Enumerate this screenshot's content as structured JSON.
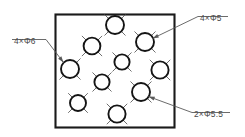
{
  "drawing": {
    "title": "Hole pattern detail",
    "canvas": {
      "width": 245,
      "height": 137,
      "background": "#ffffff"
    },
    "line_color": "#141414",
    "leader_color": "#5a5a5a",
    "centerline_color": "#555555",
    "plate": {
      "name": "plate-outline",
      "x": 55.5,
      "y": 14.5,
      "width": 119,
      "height": 113
    },
    "holes": [
      {
        "id": "hole-1",
        "cx": 115,
        "cy": 25,
        "r": 9.0,
        "callout": "4×Φ5"
      },
      {
        "id": "hole-2",
        "cx": 92,
        "cy": 46,
        "r": 8.4,
        "callout": "4×Φ6"
      },
      {
        "id": "hole-3",
        "cx": 145,
        "cy": 42,
        "r": 9.0,
        "callout": "4×Φ5"
      },
      {
        "id": "hole-4",
        "cx": 70,
        "cy": 69,
        "r": 9.0,
        "callout": "4×Φ6"
      },
      {
        "id": "hole-5",
        "cx": 122,
        "cy": 62,
        "r": 7.6,
        "callout": "4×Φ6"
      },
      {
        "id": "hole-6",
        "cx": 160,
        "cy": 70,
        "r": 8.6,
        "callout": "4×Φ5"
      },
      {
        "id": "hole-7",
        "cx": 102,
        "cy": 82,
        "r": 7.6,
        "callout": "4×Φ6"
      },
      {
        "id": "hole-8",
        "cx": 141,
        "cy": 92,
        "r": 9.0,
        "callout": "2×Φ5.5"
      },
      {
        "id": "hole-9",
        "cx": 78,
        "cy": 103,
        "r": 8.0,
        "callout": "4×Φ6"
      },
      {
        "id": "hole-10",
        "cx": 117,
        "cy": 114,
        "r": 8.6,
        "callout": "2×Φ5.5"
      }
    ],
    "callouts": [
      {
        "id": "callout-4x-d6",
        "label": "4×Φ6",
        "text_x": 14,
        "text_y": 37,
        "shelf": {
          "x1": 12,
          "y1": 39.5,
          "x2": 46,
          "y2": 39.5
        },
        "leader": {
          "x1": 46,
          "y1": 39.5,
          "x2": 63.5,
          "y2": 62.5
        },
        "arrow_angle": 52
      },
      {
        "id": "callout-4x-d5",
        "label": "4×Φ5",
        "text_x": 200,
        "text_y": 14,
        "shelf": {
          "x1": 198,
          "y1": 16.5,
          "x2": 228,
          "y2": 16.5
        },
        "leader": {
          "x1": 198,
          "y1": 16.5,
          "x2": 152.5,
          "y2": 38.5
        },
        "arrow_angle": 205
      },
      {
        "id": "callout-2x-d55",
        "label": "2×Φ5.5",
        "text_x": 194,
        "text_y": 110,
        "shelf": {
          "x1": 192,
          "y1": 112.5,
          "x2": 230,
          "y2": 112.5
        },
        "leader": {
          "x1": 192,
          "y1": 112.5,
          "x2": 148.5,
          "y2": 96.5
        },
        "arrow_angle": 200
      }
    ]
  }
}
